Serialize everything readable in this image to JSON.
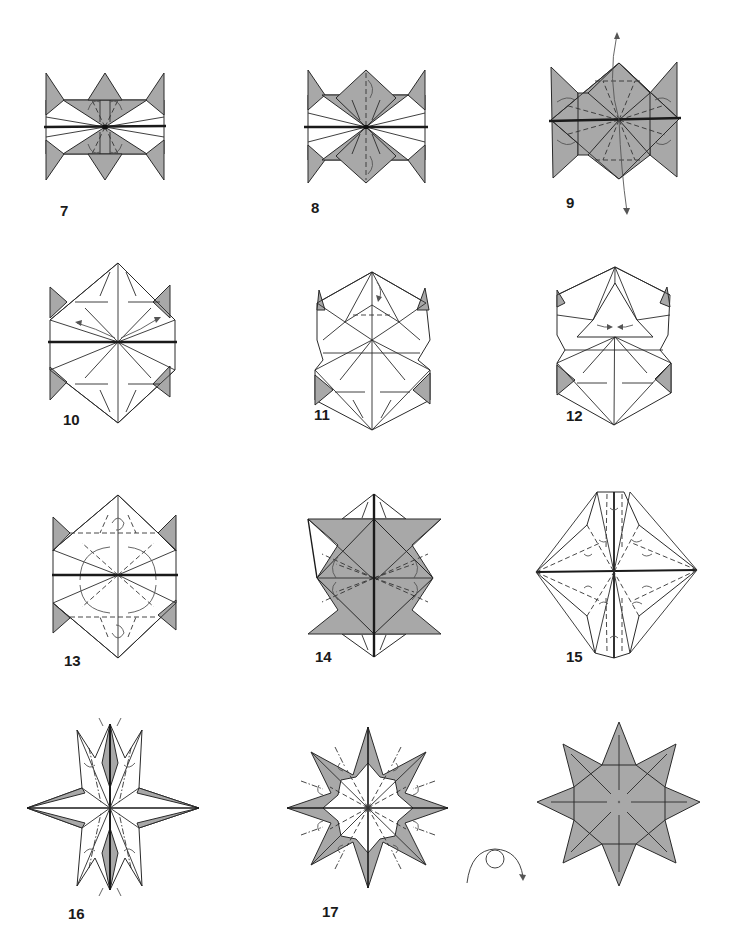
{
  "page": {
    "colors": {
      "paper_color_side": "#a8a8a8",
      "paper_white_side": "#ffffff",
      "line": "#2a2a2a"
    }
  },
  "steps": [
    {
      "number": "7",
      "label": "7",
      "description": "Square base with colored triangles; valley folds with arrows on top and bottom flaps"
    },
    {
      "number": "8",
      "label": "8",
      "description": "Colored diamonds top and bottom; flaps folded up/down"
    },
    {
      "number": "9",
      "label": "9",
      "description": "Fully colored model with long rotation arrows top and bottom"
    },
    {
      "number": "10",
      "label": "10",
      "description": "White diamond shape with small colored corner triangles; arrows pointing outward"
    },
    {
      "number": "11",
      "label": "11",
      "description": "Upper half collapsed with pleats; arrow at top"
    },
    {
      "number": "12",
      "label": "12",
      "description": "Upper section squash-folded; inward arrows"
    },
    {
      "number": "13",
      "label": "13",
      "description": "Dashed valley folds with circular arrows above and below center"
    },
    {
      "number": "14",
      "label": "14",
      "description": "Colored hourglass shape with center vertical edge; folding arrows"
    },
    {
      "number": "15",
      "label": "15",
      "description": "Four-point white shape with many dashed folds and small arrows"
    },
    {
      "number": "16",
      "label": "16",
      "description": "Elongated four-point star with gray inner strips; arrows at top and bottom"
    },
    {
      "number": "17",
      "label": "17",
      "description": "Eight-pointed star, colored with white center, small arrows between points"
    },
    {
      "number": "",
      "label": "",
      "description": "Finished eight-pointed star (turned over), fully colored"
    }
  ],
  "symbols": {
    "turn_over": "turn-over-icon"
  }
}
